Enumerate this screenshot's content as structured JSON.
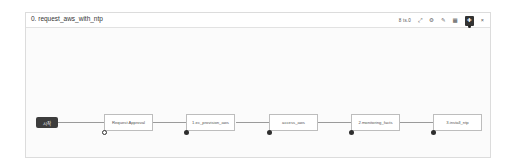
{
  "panel": {
    "title": "0. request_aws_with_ntp"
  },
  "toolbar": {
    "zoom_label": "8 ts.0",
    "icons": [
      {
        "name": "expand-icon",
        "glyph": "⤢"
      },
      {
        "name": "gear-icon",
        "glyph": "⚙"
      },
      {
        "name": "wrench-icon",
        "glyph": "✎"
      },
      {
        "name": "grid-icon",
        "glyph": "▦"
      },
      {
        "name": "pin-icon",
        "glyph": "✚"
      },
      {
        "name": "close-icon",
        "glyph": "×"
      }
    ]
  },
  "workflow": {
    "start_label": "시작",
    "nodes": [
      {
        "label": "Request Approval"
      },
      {
        "label": "1.ec_provision_aws"
      },
      {
        "label": "access_aws"
      },
      {
        "label": "2.monitoring_facts"
      },
      {
        "label": "3.install_ntp"
      }
    ]
  }
}
